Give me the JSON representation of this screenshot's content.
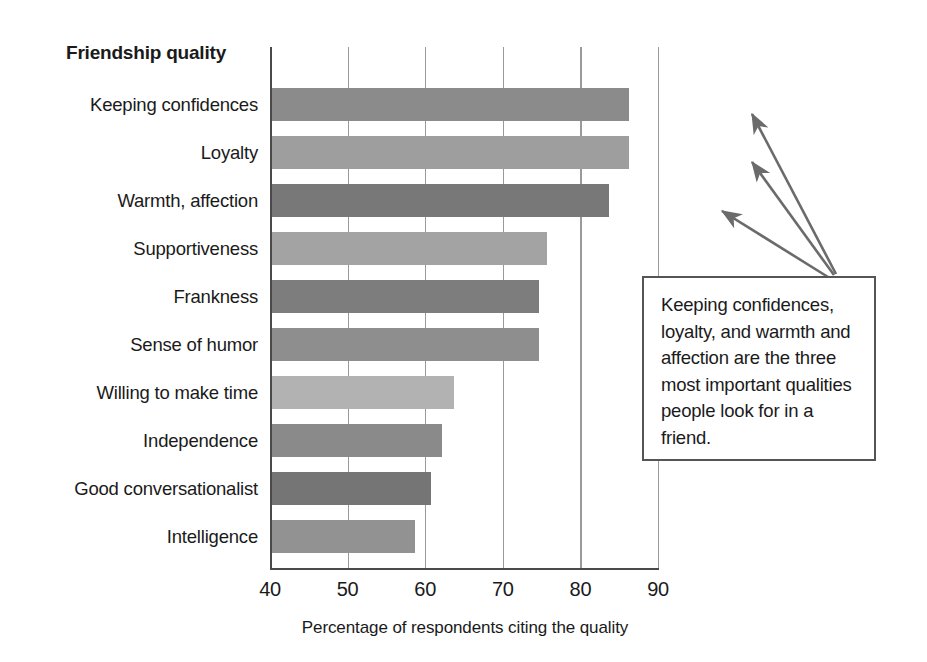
{
  "chart_data": {
    "type": "bar",
    "orientation": "horizontal",
    "title": "",
    "category_axis_title": "Friendship quality",
    "xlabel": "Percentage of respondents citing the quality",
    "ylabel": "",
    "xlim": [
      40,
      90
    ],
    "xticks": [
      40,
      50,
      60,
      70,
      80,
      90
    ],
    "grid": "vertical",
    "legend": "none",
    "categories": [
      "Keeping confidences",
      "Loyalty",
      "Warmth, affection",
      "Supportiveness",
      "Frankness",
      "Sense of humor",
      "Willing to make time",
      "Independence",
      "Good conversationalist",
      "Intelligence"
    ],
    "values": [
      86,
      86,
      83.5,
      75.5,
      74.5,
      74.5,
      63.5,
      62,
      60.5,
      58.5
    ],
    "bar_colors": [
      "#8b8b8b",
      "#9e9e9e",
      "#787878",
      "#a3a3a3",
      "#7d7d7d",
      "#8e8e8e",
      "#b2b2b2",
      "#8a8a8a",
      "#757575",
      "#929292"
    ]
  },
  "annotation": {
    "text": "Keeping confidences, loyalty, and warmth and affection are the three most important qualities people look for in a friend.",
    "points_to": [
      "Keeping confidences",
      "Loyalty",
      "Warmth, affection"
    ],
    "border_color": "#555555"
  },
  "style": {
    "axis_color": "#4a4a4a",
    "grid_color": "#9a9a9a",
    "background": "#ffffff",
    "text_color": "#1a1a1a",
    "arrow_color": "#6b6b6b"
  }
}
